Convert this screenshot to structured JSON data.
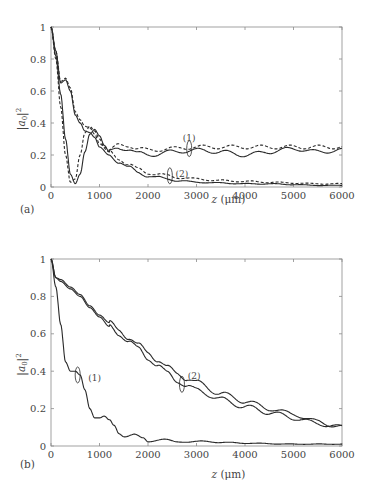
{
  "chart_data": [
    {
      "panel": "(a)",
      "type": "line",
      "title": "",
      "xlabel": "z (μm)",
      "ylabel": "|a0|^2",
      "xlim": [
        0,
        6000
      ],
      "ylim": [
        0,
        1
      ],
      "x_ticks": [
        "0",
        "1000",
        "2000",
        "3000",
        "4000",
        "5000",
        "6000"
      ],
      "y_ticks": [
        "0",
        "0.2",
        "0.4",
        "0.6",
        "0.8",
        "1"
      ],
      "grid": false,
      "legend": "none",
      "annotations": [
        {
          "text": "(1)",
          "x": 2850,
          "y": 0.29,
          "ellipse_at": [
            2850,
            0.24
          ]
        },
        {
          "text": "(2)",
          "x": 2700,
          "y": 0.06,
          "ellipse_at": [
            2450,
            0.07
          ]
        }
      ],
      "series": [
        {
          "name": "(1) dashed",
          "style": "dashed",
          "x": [
            0,
            100,
            200,
            300,
            400,
            500,
            600,
            700,
            800,
            900,
            1000,
            1100,
            1200,
            1400,
            1600,
            1800,
            2000,
            2500,
            3000,
            3500,
            4000,
            4500,
            5000,
            5500,
            6000
          ],
          "y": [
            1.0,
            0.8,
            0.5,
            0.2,
            0.03,
            0.05,
            0.2,
            0.34,
            0.38,
            0.35,
            0.3,
            0.25,
            0.23,
            0.26,
            0.26,
            0.24,
            0.23,
            0.24,
            0.25,
            0.25,
            0.25,
            0.25,
            0.25,
            0.25,
            0.25
          ]
        },
        {
          "name": "(1) solid",
          "style": "solid",
          "x": [
            0,
            100,
            200,
            300,
            400,
            500,
            600,
            700,
            800,
            900,
            1000,
            1100,
            1200,
            1400,
            1600,
            1800,
            2000,
            2500,
            3000,
            3500,
            4000,
            4500,
            5000,
            5500,
            6000
          ],
          "y": [
            1.0,
            0.82,
            0.58,
            0.3,
            0.08,
            0.02,
            0.08,
            0.22,
            0.33,
            0.36,
            0.32,
            0.26,
            0.22,
            0.24,
            0.24,
            0.21,
            0.2,
            0.22,
            0.23,
            0.22,
            0.2,
            0.22,
            0.24,
            0.22,
            0.23
          ]
        },
        {
          "name": "(2) dashed",
          "style": "dashed",
          "x": [
            0,
            100,
            200,
            300,
            400,
            500,
            600,
            700,
            800,
            900,
            1000,
            1200,
            1400,
            1600,
            1800,
            2000,
            2200,
            2400,
            2600,
            3000,
            3500,
            4000,
            4500,
            5000,
            5500,
            6000
          ],
          "y": [
            1.0,
            0.85,
            0.66,
            0.68,
            0.62,
            0.47,
            0.42,
            0.38,
            0.37,
            0.33,
            0.27,
            0.22,
            0.18,
            0.14,
            0.11,
            0.09,
            0.08,
            0.07,
            0.06,
            0.05,
            0.04,
            0.035,
            0.03,
            0.025,
            0.02,
            0.02
          ]
        },
        {
          "name": "(2) solid",
          "style": "solid",
          "x": [
            0,
            100,
            200,
            300,
            400,
            500,
            600,
            700,
            800,
            900,
            1000,
            1200,
            1400,
            1600,
            1800,
            2000,
            2200,
            2400,
            2600,
            3000,
            3500,
            4000,
            4500,
            5000,
            5500,
            6000
          ],
          "y": [
            1.0,
            0.85,
            0.65,
            0.67,
            0.6,
            0.45,
            0.4,
            0.35,
            0.34,
            0.31,
            0.25,
            0.2,
            0.16,
            0.12,
            0.09,
            0.07,
            0.06,
            0.05,
            0.04,
            0.03,
            0.025,
            0.02,
            0.02,
            0.015,
            0.01,
            0.01
          ]
        }
      ]
    },
    {
      "panel": "(b)",
      "type": "line",
      "title": "",
      "xlabel": "z (μm)",
      "ylabel": "|a0|^2",
      "xlim": [
        0,
        6000
      ],
      "ylim": [
        0,
        1
      ],
      "x_ticks": [
        "0",
        "1000",
        "2000",
        "3000",
        "4000",
        "5000",
        "6000"
      ],
      "y_ticks": [
        "0",
        "0.2",
        "0.4",
        "0.6",
        "0.8",
        "1"
      ],
      "grid": false,
      "legend": "none",
      "annotations": [
        {
          "text": "(1)",
          "x": 900,
          "y": 0.35,
          "ellipse_at": [
            550,
            0.38
          ]
        },
        {
          "text": "(2)",
          "x": 2950,
          "y": 0.36,
          "ellipse_at": [
            2700,
            0.33
          ]
        }
      ],
      "series": [
        {
          "name": "(1)",
          "style": "solid",
          "x": [
            0,
            100,
            200,
            300,
            400,
            500,
            600,
            700,
            800,
            900,
            1000,
            1100,
            1200,
            1300,
            1400,
            1500,
            1700,
            1900,
            2000,
            2300,
            2600,
            3000,
            3500,
            4000,
            5000,
            6000
          ],
          "y": [
            1.0,
            0.85,
            0.65,
            0.45,
            0.4,
            0.4,
            0.38,
            0.3,
            0.2,
            0.15,
            0.15,
            0.16,
            0.14,
            0.1,
            0.06,
            0.05,
            0.07,
            0.04,
            0.02,
            0.04,
            0.02,
            0.025,
            0.02,
            0.015,
            0.01,
            0.01
          ]
        },
        {
          "name": "(2) upper",
          "style": "solid",
          "x": [
            0,
            100,
            200,
            400,
            600,
            800,
            1000,
            1200,
            1400,
            1600,
            1800,
            2000,
            2200,
            2400,
            2600,
            2800,
            3000,
            3500,
            4000,
            4500,
            5000,
            5500,
            6000
          ],
          "y": [
            1.0,
            0.9,
            0.89,
            0.85,
            0.81,
            0.75,
            0.7,
            0.66,
            0.62,
            0.58,
            0.54,
            0.5,
            0.46,
            0.42,
            0.39,
            0.36,
            0.34,
            0.28,
            0.24,
            0.2,
            0.17,
            0.13,
            0.1
          ]
        },
        {
          "name": "(2) lower",
          "style": "solid",
          "x": [
            0,
            100,
            200,
            400,
            600,
            800,
            1000,
            1200,
            1400,
            1600,
            1800,
            2000,
            2200,
            2400,
            2600,
            2800,
            3000,
            3500,
            4000,
            4500,
            5000,
            5500,
            6000
          ],
          "y": [
            1.0,
            0.9,
            0.88,
            0.84,
            0.8,
            0.74,
            0.69,
            0.64,
            0.6,
            0.56,
            0.52,
            0.47,
            0.43,
            0.39,
            0.35,
            0.32,
            0.3,
            0.25,
            0.21,
            0.18,
            0.15,
            0.12,
            0.1
          ]
        }
      ]
    }
  ],
  "panels": {
    "a": {
      "label": "(a)"
    },
    "b": {
      "label": "(b)"
    }
  },
  "colors": {
    "line": "#2a2a2a",
    "axis": "#8a8a8a",
    "text": "#444444"
  }
}
